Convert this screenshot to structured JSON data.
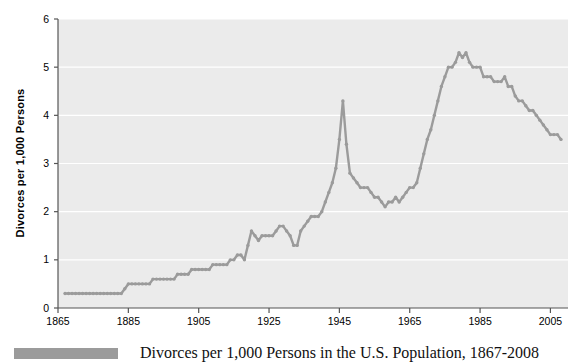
{
  "figure": {
    "caption": "Divorces per 1,000 Persons in the U.S. Population, 1867-2008",
    "legend_swatch_color": "#9b9b9b"
  },
  "chart_data": {
    "type": "line",
    "title": "",
    "subtitle": "",
    "xlabel": "",
    "ylabel": "Divorces per 1,000 Persons",
    "xlim": [
      1865,
      2010
    ],
    "ylim": [
      0,
      6
    ],
    "xticks": [
      1865,
      1885,
      1905,
      1925,
      1945,
      1965,
      1985,
      2005
    ],
    "xtick_labels": [
      "1865",
      "1885",
      "1905",
      "1925",
      "1945",
      "1965",
      "1985",
      "2005"
    ],
    "yticks": [
      0,
      1,
      2,
      3,
      4,
      5,
      6
    ],
    "ytick_labels": [
      "0",
      "1",
      "2",
      "3",
      "4",
      "5",
      "6"
    ],
    "grid": true,
    "grid_axis": "y",
    "grid_color": "#ffffff",
    "plot_bg_color": "#ebebeb",
    "line_color": "#9b9b9b",
    "marker": "circle",
    "legend_position": "below",
    "legend_entries": [
      "Divorces per 1,000 Persons in the U.S. Population, 1867-2008"
    ],
    "series": [
      {
        "name": "Divorces per 1,000 Persons",
        "x": [
          1867,
          1868,
          1869,
          1870,
          1871,
          1872,
          1873,
          1874,
          1875,
          1876,
          1877,
          1878,
          1879,
          1880,
          1881,
          1882,
          1883,
          1884,
          1885,
          1886,
          1887,
          1888,
          1889,
          1890,
          1891,
          1892,
          1893,
          1894,
          1895,
          1896,
          1897,
          1898,
          1899,
          1900,
          1901,
          1902,
          1903,
          1904,
          1905,
          1906,
          1907,
          1908,
          1909,
          1910,
          1911,
          1912,
          1913,
          1914,
          1915,
          1916,
          1917,
          1918,
          1919,
          1920,
          1921,
          1922,
          1923,
          1924,
          1925,
          1926,
          1927,
          1928,
          1929,
          1930,
          1931,
          1932,
          1933,
          1934,
          1935,
          1936,
          1937,
          1938,
          1939,
          1940,
          1941,
          1942,
          1943,
          1944,
          1945,
          1946,
          1947,
          1948,
          1949,
          1950,
          1951,
          1952,
          1953,
          1954,
          1955,
          1956,
          1957,
          1958,
          1959,
          1960,
          1961,
          1962,
          1963,
          1964,
          1965,
          1966,
          1967,
          1968,
          1969,
          1970,
          1971,
          1972,
          1973,
          1974,
          1975,
          1976,
          1977,
          1978,
          1979,
          1980,
          1981,
          1982,
          1983,
          1984,
          1985,
          1986,
          1987,
          1988,
          1989,
          1990,
          1991,
          1992,
          1993,
          1994,
          1995,
          1996,
          1997,
          1998,
          1999,
          2000,
          2001,
          2002,
          2003,
          2004,
          2005,
          2006,
          2007,
          2008
        ],
        "y": [
          0.3,
          0.3,
          0.3,
          0.3,
          0.3,
          0.3,
          0.3,
          0.3,
          0.3,
          0.3,
          0.3,
          0.3,
          0.3,
          0.3,
          0.3,
          0.3,
          0.3,
          0.4,
          0.5,
          0.5,
          0.5,
          0.5,
          0.5,
          0.5,
          0.5,
          0.6,
          0.6,
          0.6,
          0.6,
          0.6,
          0.6,
          0.6,
          0.7,
          0.7,
          0.7,
          0.7,
          0.8,
          0.8,
          0.8,
          0.8,
          0.8,
          0.8,
          0.9,
          0.9,
          0.9,
          0.9,
          0.9,
          1.0,
          1.0,
          1.1,
          1.1,
          1.0,
          1.3,
          1.6,
          1.5,
          1.4,
          1.5,
          1.5,
          1.5,
          1.5,
          1.6,
          1.7,
          1.7,
          1.6,
          1.5,
          1.3,
          1.3,
          1.6,
          1.7,
          1.8,
          1.9,
          1.9,
          1.9,
          2.0,
          2.2,
          2.4,
          2.6,
          2.9,
          3.5,
          4.3,
          3.4,
          2.8,
          2.7,
          2.6,
          2.5,
          2.5,
          2.5,
          2.4,
          2.3,
          2.3,
          2.2,
          2.1,
          2.2,
          2.2,
          2.3,
          2.2,
          2.3,
          2.4,
          2.5,
          2.5,
          2.6,
          2.9,
          3.2,
          3.5,
          3.7,
          4.0,
          4.3,
          4.6,
          4.8,
          5.0,
          5.0,
          5.1,
          5.3,
          5.2,
          5.3,
          5.1,
          5.0,
          5.0,
          5.0,
          4.8,
          4.8,
          4.8,
          4.7,
          4.7,
          4.7,
          4.8,
          4.6,
          4.6,
          4.4,
          4.3,
          4.3,
          4.2,
          4.1,
          4.1,
          4.0,
          3.9,
          3.8,
          3.7,
          3.6,
          3.6,
          3.6,
          3.5
        ]
      }
    ]
  },
  "axes": {
    "y_title": "Divorces per 1,000 Persons"
  }
}
